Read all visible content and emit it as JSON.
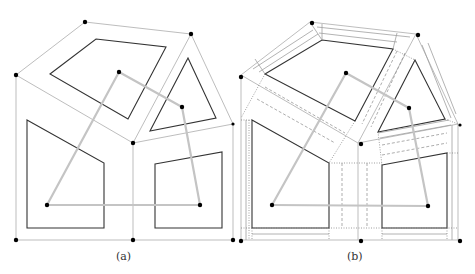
{
  "figure": {
    "panels": [
      {
        "label": "(a)",
        "description": "Polygonal subdivision with obstacles and spanning tree of cell centers"
      },
      {
        "label": "(b)",
        "description": "Same subdivision with corridor/channel decomposition around obstacles"
      }
    ]
  },
  "colors": {
    "obstacle_stroke": "#333333",
    "cell_boundary": "#b5b5b5",
    "tree_edge": "#c4c4c4",
    "vertex_dot": "#000000",
    "corridor_line": "#9a9a9a"
  }
}
